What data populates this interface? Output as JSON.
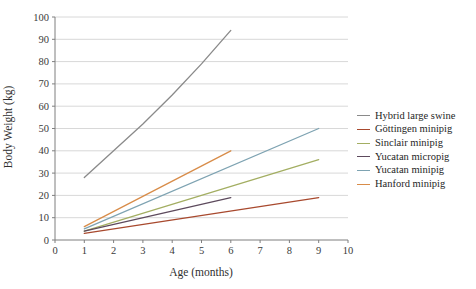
{
  "figure": {
    "background_color": "#ffffff",
    "gridline_color": "#d8d8d8",
    "axis_color": "#7f7f7f",
    "tick_label_color": "#3a3a3a"
  },
  "chart_data": {
    "type": "line",
    "title": "",
    "xlabel": "Age (months)",
    "ylabel": "Body Weight (kg)",
    "xlim": [
      0,
      10
    ],
    "ylim": [
      0,
      100
    ],
    "x_ticks": [
      0,
      1,
      2,
      3,
      4,
      5,
      6,
      7,
      8,
      9,
      10
    ],
    "y_ticks": [
      0,
      10,
      20,
      30,
      40,
      50,
      60,
      70,
      80,
      90,
      100
    ],
    "grid": "horizontal",
    "legend_position": "right-outside",
    "series": [
      {
        "name": "Hybrid large swine",
        "color": "#8a8a8a",
        "x": [
          1,
          2,
          3,
          4,
          5,
          6
        ],
        "values": [
          28,
          40,
          52,
          65,
          79,
          94
        ]
      },
      {
        "name": "Göttingen minipig",
        "color": "#a8492e",
        "x": [
          1,
          9
        ],
        "values": [
          3,
          19
        ]
      },
      {
        "name": "Sinclair minipig",
        "color": "#a3ae62",
        "x": [
          1,
          9
        ],
        "values": [
          4,
          36
        ]
      },
      {
        "name": "Yucatan micropig",
        "color": "#5d4a5d",
        "x": [
          1,
          6
        ],
        "values": [
          4,
          19
        ]
      },
      {
        "name": "Yucatan minipig",
        "color": "#7ea3b2",
        "x": [
          1,
          9
        ],
        "values": [
          5,
          50
        ]
      },
      {
        "name": "Hanford minipig",
        "color": "#d88c49",
        "x": [
          1,
          6
        ],
        "values": [
          6,
          40
        ]
      }
    ]
  }
}
